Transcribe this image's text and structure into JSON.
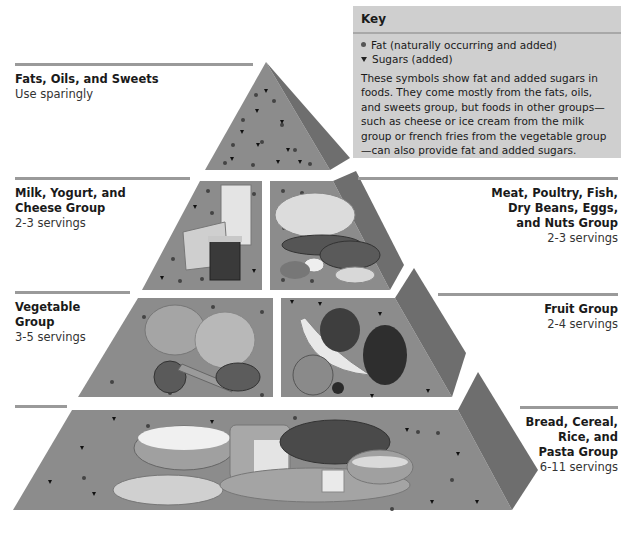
{
  "key": {
    "title": "Key",
    "items": [
      {
        "symbol": "circle-dot",
        "label": "Fat (naturally occurring and added)"
      },
      {
        "symbol": "triangle-down",
        "label": "Sugars (added)"
      }
    ],
    "description": "These symbols show fat and added sugars in foods. They come mostly from the fats, oils, and sweets group, but foods in other groups—such as cheese or ice cream from the milk group or french fries from the vegetable group—can also provide fat and added sugars."
  },
  "tiers": [
    {
      "title": "Fats, Oils, and Sweets",
      "subtitle": "Use sparingly",
      "side": "left"
    },
    {
      "title": "Milk, Yogurt, and\nCheese Group",
      "subtitle": "2-3 servings",
      "side": "left"
    },
    {
      "title": "Meat, Poultry, Fish,\nDry Beans, Eggs,\nand Nuts Group",
      "subtitle": "2-3 servings",
      "side": "right"
    },
    {
      "title": "Vegetable\nGroup",
      "subtitle": "3-5 servings",
      "side": "left"
    },
    {
      "title": "Fruit Group",
      "subtitle": "2-4 servings",
      "side": "right"
    },
    {
      "title": "Bread, Cereal,\nRice, and\nPasta Group",
      "subtitle": "6-11 servings",
      "side": "right"
    }
  ],
  "pyramid": {
    "front_color": "#8c8c8c",
    "side_color": "#6e6e6e",
    "gap_color": "#f2f2f2",
    "food_illustrations": [
      "milk glass, cheese wedge, yogurt cup",
      "roast chicken, fish, steak, eggs, dry beans, nuts",
      "broccoli, cabbage, tomato, carrots, potato",
      "banana, apple, orange, cherries, grapes",
      "rice bowl, spaghetti plate, bread loaves, crackers, cereal bowl"
    ]
  }
}
